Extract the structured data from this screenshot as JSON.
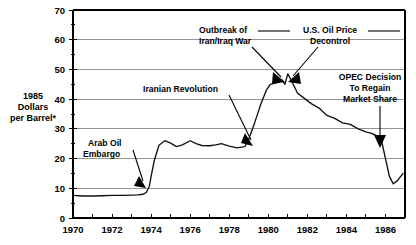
{
  "chart_data": {
    "type": "line",
    "title": "",
    "subtitle": "",
    "xlabel": "",
    "ylabel": "1985 Dollars per Barrel*",
    "ylabel_lines": [
      "1985",
      "Dollars",
      "per Barrel*"
    ],
    "xlim": [
      1970,
      1987
    ],
    "ylim": [
      0,
      70
    ],
    "y_ticks": [
      0,
      10,
      20,
      30,
      40,
      50,
      60,
      70
    ],
    "y_tick_labels": [
      "0",
      "10",
      "20",
      "30",
      "40",
      "50",
      "60",
      "70"
    ],
    "y_minor_ticks": [
      5,
      15,
      25,
      35,
      45,
      55,
      65
    ],
    "x_ticks": [
      1970,
      1971,
      1972,
      1973,
      1974,
      1975,
      1976,
      1977,
      1978,
      1979,
      1980,
      1981,
      1982,
      1983,
      1984,
      1985,
      1986
    ],
    "x_tick_labels_shown": [
      "1970",
      "1972",
      "1974",
      "1976",
      "1978",
      "1980",
      "1982",
      "1984",
      "1986"
    ],
    "grid": "horizontal",
    "legend": "none",
    "series": [
      {
        "name": "Crude oil price (1985 dollars per barrel)",
        "x": [
          1970.0,
          1970.5,
          1971.0,
          1971.5,
          1972.0,
          1972.5,
          1973.0,
          1973.3,
          1973.6,
          1973.75,
          1973.9,
          1974.0,
          1974.15,
          1974.4,
          1974.7,
          1975.0,
          1975.3,
          1975.6,
          1976.0,
          1976.3,
          1976.6,
          1977.0,
          1977.3,
          1977.6,
          1978.0,
          1978.4,
          1978.8,
          1979.0,
          1979.3,
          1979.6,
          1979.9,
          1980.1,
          1980.4,
          1980.7,
          1980.85,
          1981.0,
          1981.2,
          1981.5,
          1981.8,
          1982.2,
          1982.6,
          1983.0,
          1983.4,
          1983.8,
          1984.2,
          1984.6,
          1985.0,
          1985.3,
          1985.6,
          1985.8,
          1986.0,
          1986.2,
          1986.4,
          1986.6,
          1986.9
        ],
        "y": [
          7.6,
          7.4,
          7.4,
          7.5,
          7.6,
          7.6,
          7.7,
          7.8,
          8.0,
          8.6,
          10.5,
          14.0,
          19.0,
          24.5,
          26.0,
          25.2,
          24.0,
          24.6,
          26.0,
          25.0,
          24.4,
          24.3,
          24.6,
          25.0,
          24.2,
          23.6,
          24.0,
          26.5,
          32.0,
          38.0,
          43.0,
          45.0,
          45.5,
          46.5,
          45.0,
          48.5,
          46.0,
          42.0,
          40.5,
          38.5,
          37.0,
          34.5,
          33.5,
          32.0,
          31.5,
          30.0,
          29.0,
          28.5,
          27.5,
          26.0,
          20.0,
          14.0,
          11.5,
          12.5,
          15.0
        ],
        "color": "#111111"
      }
    ],
    "annotations": [
      {
        "id": "arab-oil-embargo",
        "label_lines": [
          "Arab Oil",
          "Embargo"
        ],
        "label": "Arab Oil Embargo",
        "point_year": 1973.85,
        "point_value": 11.5
      },
      {
        "id": "iranian-revolution",
        "label_lines": [
          "Iranian Revolution"
        ],
        "label": "Iranian Revolution",
        "point_year": 1979.15,
        "point_value": 27.0
      },
      {
        "id": "outbreak-iran-iraq-war",
        "label_lines": [
          "Outbreak of",
          "Iran/Iraq War"
        ],
        "label": "Outbreak of Iran/Iraq War",
        "point_year": 1980.55,
        "point_value": 46.0
      },
      {
        "id": "us-oil-price-decontrol",
        "label_lines": [
          "U.S. Oil Price",
          "Decontrol"
        ],
        "label": "U.S. Oil Price Decontrol",
        "point_year": 1981.1,
        "point_value": 46.5
      },
      {
        "id": "opec-decision",
        "label_lines": [
          "OPEC Decision",
          "To Regain",
          "Market Share"
        ],
        "label": "OPEC Decision To Regain Market Share",
        "point_year": 1985.75,
        "point_value": 26.5
      }
    ],
    "colors": {
      "line": "#111111",
      "grid": "#8a8a8a",
      "axis": "#000000",
      "background": "#ffffff"
    }
  }
}
